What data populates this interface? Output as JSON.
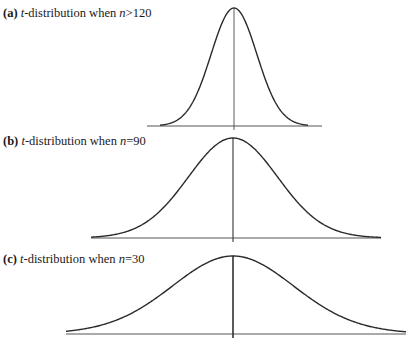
{
  "panels": [
    {
      "id": "a",
      "tag": "(a)",
      "t": "t",
      "text": "-distribution when ",
      "n": "n",
      "cond": ">120",
      "label_pos": {
        "x": 3,
        "y": 7
      },
      "center_x": 234,
      "peak_y": 8,
      "baseline_y": 126,
      "baseline_x": [
        147,
        322
      ],
      "curve_x": [
        160,
        308
      ],
      "axis_bottom": 130,
      "axis_stroke": 0.8,
      "scale": 23,
      "df": 120
    },
    {
      "id": "b",
      "tag": "(b)",
      "t": "t",
      "text": "-distribution when ",
      "n": "n",
      "cond": "=90",
      "label_pos": {
        "x": 3,
        "y": 135
      },
      "center_x": 233,
      "peak_y": 138,
      "baseline_y": 238,
      "baseline_x": [
        91,
        381
      ],
      "curve_x": [
        91,
        381
      ],
      "axis_bottom": 242,
      "axis_stroke": 1.1,
      "scale": 45,
      "df": 90
    },
    {
      "id": "c",
      "tag": "(c)",
      "t": "t",
      "text": "-distribution when ",
      "n": "n",
      "cond": "=30",
      "label_pos": {
        "x": 3,
        "y": 253
      },
      "center_x": 233,
      "peak_y": 256,
      "baseline_y": 334,
      "baseline_x": [
        66,
        406
      ],
      "curve_x": [
        66,
        406
      ],
      "axis_bottom": 338,
      "axis_stroke": 1.6,
      "scale": 62,
      "df": 30
    }
  ]
}
